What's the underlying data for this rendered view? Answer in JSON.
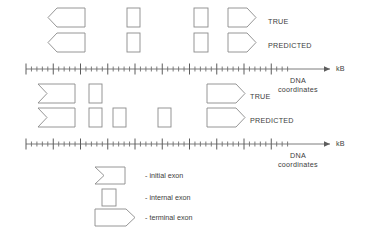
{
  "figure": {
    "type": "gene-structure-annotation-diagram",
    "background": "#ffffff",
    "stroke_color": "#8a8a8a",
    "text_color": "#3d3d3d",
    "width": 384,
    "height": 230
  },
  "panels": [
    {
      "id": "panel-top",
      "rows": [
        {
          "id": "row-true-1",
          "label": "TRUE",
          "label_x": 268,
          "label_y": 18,
          "exons": [
            {
              "kind": "initial-exon",
              "x": 48,
              "y": 8,
              "w": 37,
              "h": 19
            },
            {
              "kind": "internal-exon",
              "x": 127,
              "y": 8,
              "w": 13,
              "h": 19
            },
            {
              "kind": "internal-exon",
              "x": 194,
              "y": 8,
              "w": 14,
              "h": 19
            },
            {
              "kind": "terminal-exon",
              "x": 228,
              "y": 8,
              "w": 28,
              "h": 19
            }
          ]
        },
        {
          "id": "row-predicted-1",
          "label": "PREDICTED",
          "label_x": 268,
          "label_y": 42,
          "exons": [
            {
              "kind": "initial-exon",
              "x": 48,
              "y": 33,
              "w": 37,
              "h": 19
            },
            {
              "kind": "internal-exon",
              "x": 127,
              "y": 33,
              "w": 13,
              "h": 19
            },
            {
              "kind": "internal-exon",
              "x": 194,
              "y": 33,
              "w": 14,
              "h": 19
            },
            {
              "kind": "terminal-exon",
              "x": 228,
              "y": 33,
              "w": 28,
              "h": 19
            }
          ]
        }
      ],
      "axis": {
        "id": "axis-top",
        "y": 69,
        "x_start": 26,
        "x_end": 330,
        "ticked_until": 292,
        "minor_step": 5.45,
        "major_every": 5,
        "minor_tick_h": 5,
        "major_tick_h": 11,
        "arrow": true,
        "unit_label": "kB",
        "caption_line1": "DNA",
        "caption_line2": "coordinates"
      }
    },
    {
      "id": "panel-bottom",
      "rows": [
        {
          "id": "row-true-2",
          "label": "TRUE",
          "label_x": 250,
          "label_y": 93,
          "exons": [
            {
              "kind": "initial-exon-notched",
              "x": 38,
              "y": 84,
              "w": 37,
              "h": 19
            },
            {
              "kind": "internal-exon",
              "x": 89,
              "y": 84,
              "w": 13,
              "h": 19
            },
            {
              "kind": "terminal-exon",
              "x": 207,
              "y": 84,
              "w": 38,
              "h": 19
            }
          ]
        },
        {
          "id": "row-predicted-2",
          "label": "PREDICTED",
          "label_x": 250,
          "label_y": 117,
          "exons": [
            {
              "kind": "initial-exon-notched",
              "x": 38,
              "y": 108,
              "w": 37,
              "h": 19
            },
            {
              "kind": "internal-exon",
              "x": 89,
              "y": 108,
              "w": 13,
              "h": 19
            },
            {
              "kind": "internal-exon",
              "x": 113,
              "y": 108,
              "w": 13,
              "h": 19
            },
            {
              "kind": "internal-exon",
              "x": 158,
              "y": 108,
              "w": 13,
              "h": 19
            },
            {
              "kind": "terminal-exon",
              "x": 207,
              "y": 108,
              "w": 38,
              "h": 19
            }
          ]
        }
      ],
      "axis": {
        "id": "axis-bottom",
        "y": 144,
        "x_start": 26,
        "x_end": 330,
        "ticked_until": 292,
        "minor_step": 5.45,
        "major_every": 5,
        "minor_tick_h": 5,
        "major_tick_h": 11,
        "arrow": true,
        "unit_label": "kB",
        "caption_line1": "DNA",
        "caption_line2": "coordinates"
      }
    }
  ],
  "legend": {
    "id": "legend",
    "items": [
      {
        "kind": "initial-exon-notched",
        "text": "- initial exon",
        "sx": 95,
        "sy": 167,
        "sw": 30,
        "sh": 17,
        "tx": 145,
        "ty": 172
      },
      {
        "kind": "internal-exon",
        "text": "- internal exon",
        "sx": 102,
        "sy": 189,
        "sw": 14,
        "sh": 17,
        "tx": 145,
        "ty": 194
      },
      {
        "kind": "terminal-exon",
        "text": "- terminal exon",
        "sx": 95,
        "sy": 209,
        "sw": 40,
        "sh": 17,
        "tx": 145,
        "ty": 214
      }
    ]
  }
}
